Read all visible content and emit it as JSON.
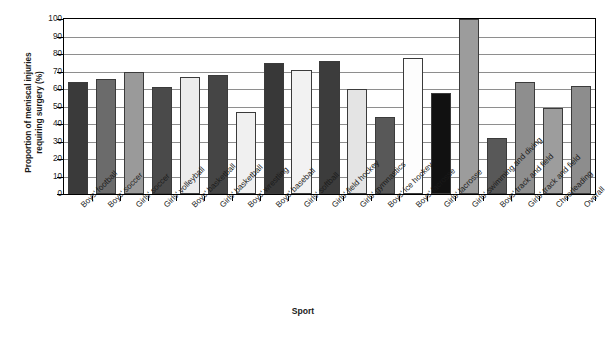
{
  "chart_data": {
    "type": "bar",
    "title": "",
    "xlabel": "Sport",
    "ylabel": "Proportion of meniscal injuries\nrequiring surgery (%)",
    "ylim": [
      0,
      100
    ],
    "yticks": [
      0,
      10,
      20,
      30,
      40,
      50,
      60,
      70,
      80,
      90,
      100
    ],
    "grid": true,
    "legend": "none",
    "categories": [
      "Boys' football",
      "Boys' soccer",
      "Girls' soccer",
      "Girls' volleyball",
      "Boys' basketball",
      "Girls' basketball",
      "Boys' wrestling",
      "Boys' baseball",
      "Girls' softball",
      "Girls' field hockey",
      "Girls' gymnastics",
      "Boys' ice hockey",
      "Boys' lacrosse",
      "Girls' lacrosse",
      "Girls' swimming and diving",
      "Boys' track and field",
      "Girls' track and field",
      "Cheerleading",
      "Overall"
    ],
    "values": [
      64,
      66,
      70,
      61,
      67,
      68,
      47,
      75,
      71,
      76,
      60,
      44,
      78,
      58,
      100,
      32,
      64,
      49,
      62
    ],
    "bar_colors": [
      "#3a3a3a",
      "#6b6b6b",
      "#9a9a9a",
      "#4a4a4a",
      "#ececec",
      "#454545",
      "#f0f0f0",
      "#383838",
      "#f2f2f2",
      "#3c3c3c",
      "#e4e4e4",
      "#585858",
      "#fdfdfd",
      "#111111",
      "#9c9c9c",
      "#585858",
      "#8e8e8e",
      "#9d9d9d",
      "#8d8d8d"
    ]
  },
  "axis": {
    "x_title": "Sport",
    "y_title": "Proportion of meniscal injuries\nrequiring surgery (%)"
  },
  "caption": {
    "text": ""
  },
  "colors": {
    "axis": "#000000",
    "grid": "#8e8e8e",
    "bar_outline": "#3b3b3b",
    "background": "#ffffff",
    "text": "#1a1a1a"
  }
}
